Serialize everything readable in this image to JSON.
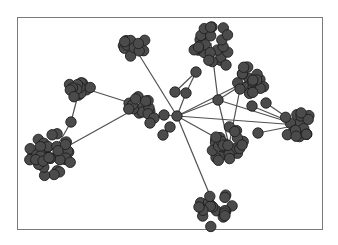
{
  "diagram": {
    "type": "network-graph",
    "frame": {
      "x": 17,
      "y": 17,
      "width": 306,
      "height": 213,
      "border_color": "#7a7a7a"
    },
    "colors": {
      "node_fill": "#4b4b4b",
      "node_stroke": "#1e1e1e",
      "edge": "#505050",
      "background": "#ffffff"
    },
    "clusters": [
      {
        "id": "A",
        "cx": 133,
        "cy": 45,
        "r": 17,
        "n": 14
      },
      {
        "id": "B",
        "cx": 211,
        "cy": 43,
        "r": 24,
        "n": 26
      },
      {
        "id": "C",
        "cx": 251,
        "cy": 79,
        "r": 19,
        "n": 18
      },
      {
        "id": "D",
        "cx": 80,
        "cy": 87,
        "r": 16,
        "n": 14
      },
      {
        "id": "E",
        "cx": 140,
        "cy": 106,
        "r": 16,
        "n": 14
      },
      {
        "id": "F",
        "cx": 52,
        "cy": 155,
        "r": 27,
        "n": 34
      },
      {
        "id": "G",
        "cx": 298,
        "cy": 125,
        "r": 19,
        "n": 18
      },
      {
        "id": "H",
        "cx": 229,
        "cy": 145,
        "r": 23,
        "n": 26
      },
      {
        "id": "I",
        "cx": 216,
        "cy": 210,
        "r": 22,
        "n": 20
      }
    ],
    "single_nodes": [
      {
        "id": "hub",
        "x": 177,
        "y": 116
      },
      {
        "id": "n1",
        "x": 164,
        "y": 115
      },
      {
        "id": "n2",
        "x": 170,
        "y": 127
      },
      {
        "id": "n3",
        "x": 163,
        "y": 135
      },
      {
        "id": "n4",
        "x": 154,
        "y": 118
      },
      {
        "id": "n5",
        "x": 196,
        "y": 72
      },
      {
        "id": "n6",
        "x": 175,
        "y": 92
      },
      {
        "id": "n7",
        "x": 186,
        "y": 93
      },
      {
        "id": "n8",
        "x": 218,
        "y": 100
      },
      {
        "id": "n9",
        "x": 252,
        "y": 106
      },
      {
        "id": "n10",
        "x": 266,
        "y": 103
      },
      {
        "id": "n11",
        "x": 258,
        "y": 133
      },
      {
        "id": "n12",
        "x": 71,
        "y": 122
      },
      {
        "id": "n13",
        "x": 226,
        "y": 65
      },
      {
        "id": "n14",
        "x": 240,
        "y": 89
      },
      {
        "id": "n15",
        "x": 150,
        "y": 123
      }
    ],
    "edges": [
      [
        "hub",
        "A"
      ],
      [
        "hub",
        "I"
      ],
      [
        "hub",
        "H"
      ],
      [
        "hub",
        "G"
      ],
      [
        "hub",
        "C"
      ],
      [
        "hub",
        "n8"
      ],
      [
        "hub",
        "n7"
      ],
      [
        "n7",
        "n5"
      ],
      [
        "n6",
        "n5"
      ],
      [
        "n8",
        "B"
      ],
      [
        "n8",
        "H"
      ],
      [
        "n8",
        "G"
      ],
      [
        "n14",
        "H"
      ],
      [
        "n9",
        "G"
      ],
      [
        "n10",
        "G"
      ],
      [
        "n11",
        "G"
      ],
      [
        "E",
        "D"
      ],
      [
        "E",
        "F"
      ],
      [
        "D",
        "n12"
      ],
      [
        "n12",
        "F"
      ],
      [
        "n8",
        "C"
      ],
      [
        "hub",
        "n1"
      ]
    ]
  }
}
